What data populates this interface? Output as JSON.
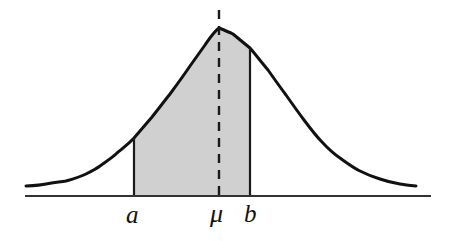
{
  "figure": {
    "name": "normal-distribution-shaded-interval",
    "title": "",
    "background_color": "#ffffff"
  },
  "colors": {
    "curve": "#111111",
    "axis": "#333333",
    "shaded_area": "#d0d0d0",
    "boundary_line": "#1a1a1a",
    "mean_dashed_line": "#1a1a1a",
    "label_text": "#121212"
  },
  "labels": {
    "lower_bound": "a",
    "mean": "μ",
    "upper_bound": "b"
  },
  "chart_data": {
    "type": "area",
    "title": "",
    "xlabel": "",
    "ylabel": "",
    "distribution": "normal",
    "grid": false,
    "legend": null,
    "axis": {
      "x_start_px": 25,
      "x_end_px": 431,
      "baseline_y_px": 196
    },
    "curve": {
      "peak_x_px": 219,
      "peak_y_px": 28,
      "left_tail_x_px": 26,
      "left_tail_y_px": 186,
      "right_tail_x_px": 416,
      "right_tail_y_px": 186,
      "points": [
        [
          26,
          186
        ],
        [
          46,
          184
        ],
        [
          66,
          181
        ],
        [
          86,
          174
        ],
        [
          100,
          166
        ],
        [
          117,
          153
        ],
        [
          134,
          138
        ],
        [
          152,
          117
        ],
        [
          170,
          94
        ],
        [
          190,
          66
        ],
        [
          205,
          45
        ],
        [
          219,
          28
        ],
        [
          233,
          34
        ],
        [
          250,
          48
        ],
        [
          268,
          70
        ],
        [
          286,
          95
        ],
        [
          304,
          120
        ],
        [
          322,
          142
        ],
        [
          340,
          158
        ],
        [
          360,
          171
        ],
        [
          380,
          179
        ],
        [
          400,
          184
        ],
        [
          416,
          186
        ]
      ]
    },
    "shaded_region": {
      "fill": "#d0d0d0",
      "lower_bound_x_px": 134,
      "lower_bound_top_y_px": 138,
      "upper_bound_x_px": 250,
      "upper_bound_top_y_px": 48,
      "label_lower": "a",
      "label_upper": "b",
      "description": "Area under the normal curve between a and b"
    },
    "mean_line": {
      "x_px": 219,
      "top_y_px": 10,
      "bottom_y_px": 196,
      "style": "dashed",
      "dash_pattern": "9 7",
      "label": "μ"
    },
    "tick_labels": [
      {
        "text": "a",
        "x_px": 133,
        "y_px": 200
      },
      {
        "text": "μ",
        "x_px": 218,
        "y_px": 200
      },
      {
        "text": "b",
        "x_px": 250,
        "y_px": 200
      }
    ]
  }
}
